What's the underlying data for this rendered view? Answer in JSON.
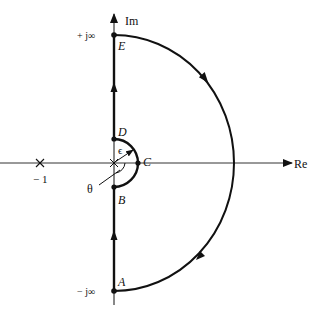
{
  "diagram": {
    "type": "nyquist-contour",
    "colors": {
      "stroke": "#111111",
      "background": "#ffffff"
    },
    "axes": {
      "real_label": "Re",
      "imag_label": "Im"
    },
    "point_labels": {
      "A": "A",
      "B": "B",
      "C": "C",
      "D": "D",
      "E": "E"
    },
    "annotations": {
      "plus_j_inf": "+ j∞",
      "minus_j_inf": "− j∞",
      "minus_one": "− 1",
      "epsilon": "ϵ",
      "theta": "θ"
    },
    "markers": {
      "critical_point": "×",
      "origin": "×"
    }
  }
}
